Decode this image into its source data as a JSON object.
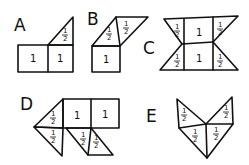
{
  "figures": [
    {
      "id": "A",
      "label": "A",
      "pieces": [
        {
          "kind": "square",
          "value": "1"
        },
        {
          "kind": "square",
          "value": "1"
        },
        {
          "kind": "triangle",
          "value": "1/2"
        }
      ]
    },
    {
      "id": "B",
      "label": "B",
      "pieces": [
        {
          "kind": "square",
          "value": "1"
        },
        {
          "kind": "triangle",
          "value": "1/2"
        },
        {
          "kind": "triangle",
          "value": "1/2"
        }
      ]
    },
    {
      "id": "C",
      "label": "C",
      "pieces": [
        {
          "kind": "square",
          "value": "1"
        },
        {
          "kind": "square",
          "value": "1"
        },
        {
          "kind": "triangle",
          "value": "1/2"
        },
        {
          "kind": "triangle",
          "value": "1/2"
        },
        {
          "kind": "triangle",
          "value": "1/2"
        },
        {
          "kind": "triangle",
          "value": "1/2"
        }
      ]
    },
    {
      "id": "D",
      "label": "D",
      "pieces": [
        {
          "kind": "square",
          "value": "1"
        },
        {
          "kind": "square",
          "value": "1"
        },
        {
          "kind": "triangle",
          "value": "1/2"
        },
        {
          "kind": "triangle",
          "value": "1/2"
        },
        {
          "kind": "triangle",
          "value": "1/2"
        },
        {
          "kind": "triangle",
          "value": "1/2"
        }
      ]
    },
    {
      "id": "E",
      "label": "E",
      "pieces": [
        {
          "kind": "triangle",
          "value": "1/2"
        },
        {
          "kind": "triangle",
          "value": "1/2"
        },
        {
          "kind": "triangle",
          "value": "1/2"
        },
        {
          "kind": "triangle",
          "value": "1/2"
        }
      ]
    }
  ],
  "labels": {
    "A": "A",
    "B": "B",
    "C": "C",
    "D": "D",
    "E": "E"
  },
  "values": {
    "one": "1",
    "half_num": "1",
    "half_den": "2"
  }
}
